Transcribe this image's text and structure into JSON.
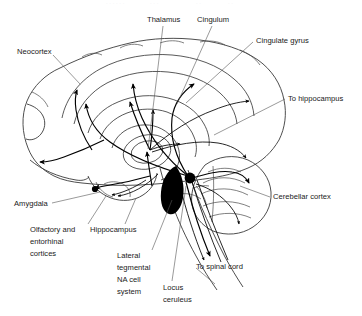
{
  "figure": {
    "kind": "neuroanatomy-diagram",
    "background_color": "#ffffff",
    "ink_color": "#1a1a1a"
  },
  "labels": {
    "neocortex": "Neocortex",
    "thalamus": "Thalamus",
    "cingulum": "Cingulum",
    "cingulate_gyrus": "Cingulate gyrus",
    "to_hippocampus": "To hippocampus",
    "cerebellar_cortex": "Cerebellar cortex",
    "amygdala": "Amygdala",
    "hippocampus": "Hippocampus",
    "to_spinal_cord": "To spinal cord",
    "olfactory_entorhinal": [
      "Olfactory and",
      "entorhinal",
      "cortices"
    ],
    "lateral_tegmental": [
      "Lateral",
      "tegmental",
      "NA cell",
      "system"
    ],
    "locus_ceruleus": [
      "Locus",
      "ceruleus"
    ]
  },
  "structures": {
    "locus_ceruleus_marker": "filled-circle",
    "lateral_tegmental_marker": "filled-teardrop"
  }
}
